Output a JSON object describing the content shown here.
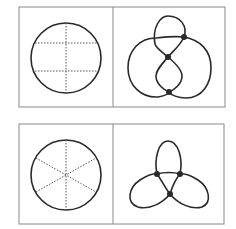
{
  "diagram": {
    "colors": {
      "stroke": "#2a2a2a",
      "frame": "#8a8a8a",
      "dotted": "#555555",
      "background": "#ffffff"
    },
    "rows": [
      {
        "left": {
          "shape": "circle",
          "divisions": "one vertical and two horizontal dotted lines (grid)"
        },
        "right": {
          "shape": "loop figure with top small loop, central figure-eight and outer lobes",
          "crossing_dots": 3
        }
      },
      {
        "left": {
          "shape": "circle",
          "divisions": "three dotted diameters at 60 degree intervals (six sectors)"
        },
        "right": {
          "shape": "three-lobed trefoil",
          "crossing_dots": 3
        }
      }
    ]
  }
}
